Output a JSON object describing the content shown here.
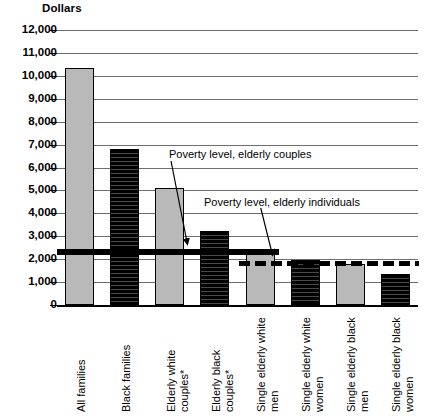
{
  "chart_data": {
    "type": "bar",
    "title": "",
    "xlabel": "",
    "ylabel": "Dollars",
    "ylim": [
      0,
      12000
    ],
    "ytick_labels": [
      "12,000",
      "11,000",
      "10,000",
      "9,000",
      "8,000",
      "7,000",
      "6,000",
      "5,000",
      "4,000",
      "3,000",
      "2,000",
      "1,000",
      "0"
    ],
    "ytick_values": [
      12000,
      11000,
      10000,
      9000,
      8000,
      7000,
      6000,
      5000,
      4000,
      3000,
      2000,
      1000,
      0
    ],
    "grid": true,
    "legend_position": "none",
    "categories": [
      "All families",
      "Black families",
      "Elderly white couples*",
      "Elderly black couples*",
      "Single elderly white men",
      "Single elderly white women",
      "Single elderly black men",
      "Single elderly black women"
    ],
    "values": [
      10350,
      6800,
      5100,
      3250,
      2400,
      1950,
      1800,
      1350
    ],
    "bar_styles": [
      "gray",
      "hatch",
      "gray",
      "hatch",
      "gray",
      "hatch",
      "gray",
      "hatch"
    ],
    "reference_lines": [
      {
        "label": "Poverty level, elderly couples",
        "value": 2300,
        "style": "solid-thick",
        "color": "#000000"
      },
      {
        "label": "Poverty level, elderly individuals",
        "value": 1830,
        "style": "dashed-thick",
        "color": "#000000"
      }
    ],
    "annotations": [
      "Poverty level, elderly couples",
      "Poverty level, elderly individuals"
    ],
    "footnote_marker": "*"
  },
  "colors": {
    "bar_gray": "#b9b9b9",
    "bar_dark": "#000000",
    "gridline": "#6e6e6e",
    "axis": "#000000",
    "background": "#ffffff"
  }
}
